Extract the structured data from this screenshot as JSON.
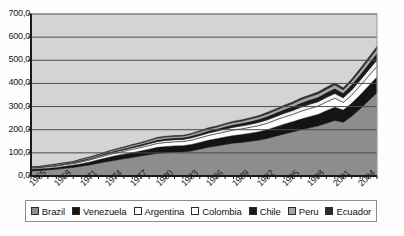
{
  "chart_data": {
    "type": "area",
    "stacked": true,
    "title": "",
    "subtitle": "",
    "xlabel": "",
    "ylabel": "",
    "grid": true,
    "legend_position": "bottom",
    "ylim": [
      0,
      700
    ],
    "ytick_step": 100,
    "ytick_labels": [
      "0,0",
      "100,0",
      "200,0",
      "300,0",
      "400,0",
      "500,0",
      "600,0",
      "700,0"
    ],
    "ytick_values": [
      0,
      100,
      200,
      300,
      400,
      500,
      600,
      700
    ],
    "xlim": [
      1965,
      2006
    ],
    "xtick_labels": [
      "1965",
      "1968",
      "1971",
      "1974",
      "1977",
      "1980",
      "1983",
      "1986",
      "1989",
      "1992",
      "1995",
      "1998",
      "2001",
      "2004"
    ],
    "xtick_values": [
      1965,
      1968,
      1971,
      1974,
      1977,
      1980,
      1983,
      1986,
      1989,
      1992,
      1995,
      1998,
      2001,
      2004
    ],
    "x": [
      1965,
      1966,
      1967,
      1968,
      1969,
      1970,
      1971,
      1972,
      1973,
      1974,
      1975,
      1976,
      1977,
      1978,
      1979,
      1980,
      1981,
      1982,
      1983,
      1984,
      1985,
      1986,
      1987,
      1988,
      1989,
      1990,
      1991,
      1992,
      1993,
      1994,
      1995,
      1996,
      1997,
      1998,
      1999,
      2000,
      2001,
      2002,
      2003,
      2004,
      2005,
      2006
    ],
    "series": [
      {
        "name": "Brazil",
        "color": "#8d8d8d",
        "values": [
          22,
          24,
          26,
          29,
          33,
          37,
          42,
          48,
          55,
          62,
          68,
          74,
          80,
          86,
          92,
          98,
          100,
          103,
          104,
          108,
          116,
          124,
          130,
          136,
          142,
          145,
          150,
          155,
          162,
          172,
          182,
          190,
          200,
          208,
          216,
          228,
          240,
          232,
          258,
          290,
          325,
          360
        ]
      },
      {
        "name": "Venezuela",
        "color": "#141414",
        "values": [
          7,
          7,
          8,
          8,
          9,
          10,
          11,
          13,
          15,
          17,
          19,
          20,
          21,
          22,
          24,
          26,
          27,
          27,
          27,
          28,
          29,
          30,
          31,
          32,
          33,
          34,
          35,
          36,
          38,
          40,
          42,
          44,
          46,
          48,
          50,
          54,
          57,
          53,
          56,
          60,
          64,
          68
        ]
      },
      {
        "name": "Argentina",
        "color": "#fdfdfd",
        "values": [
          5,
          5,
          6,
          6,
          7,
          7,
          8,
          9,
          10,
          11,
          12,
          13,
          14,
          15,
          16,
          17,
          18,
          18,
          18,
          19,
          20,
          21,
          22,
          23,
          24,
          25,
          26,
          27,
          28,
          30,
          31,
          32,
          34,
          35,
          36,
          38,
          39,
          33,
          36,
          40,
          43,
          46
        ]
      },
      {
        "name": "Colombia",
        "color": "#f2f2f2",
        "values": [
          2,
          2,
          2,
          3,
          3,
          3,
          4,
          4,
          5,
          5,
          6,
          6,
          7,
          7,
          8,
          8,
          9,
          9,
          9,
          10,
          10,
          11,
          11,
          12,
          12,
          13,
          13,
          14,
          15,
          15,
          16,
          17,
          18,
          19,
          19,
          20,
          21,
          20,
          22,
          24,
          26,
          28
        ]
      },
      {
        "name": "Chile",
        "color": "#1a1a1a",
        "values": [
          2,
          2,
          2,
          3,
          3,
          3,
          4,
          4,
          4,
          5,
          5,
          6,
          6,
          7,
          7,
          8,
          8,
          8,
          8,
          9,
          9,
          10,
          10,
          11,
          12,
          12,
          13,
          14,
          15,
          16,
          17,
          18,
          19,
          20,
          20,
          21,
          22,
          21,
          23,
          25,
          27,
          29
        ]
      },
      {
        "name": "Peru",
        "color": "#a6a6a6",
        "values": [
          1,
          1,
          2,
          2,
          2,
          2,
          3,
          3,
          3,
          4,
          4,
          4,
          5,
          5,
          5,
          6,
          6,
          6,
          6,
          6,
          7,
          7,
          7,
          8,
          8,
          8,
          9,
          9,
          10,
          10,
          11,
          11,
          12,
          12,
          13,
          13,
          14,
          13,
          14,
          15,
          16,
          17
        ]
      },
      {
        "name": "Ecuador",
        "color": "#2b2b2b",
        "values": [
          1,
          1,
          1,
          1,
          1,
          1,
          2,
          2,
          2,
          2,
          3,
          3,
          3,
          3,
          4,
          4,
          4,
          4,
          4,
          4,
          5,
          5,
          5,
          5,
          6,
          6,
          6,
          6,
          7,
          7,
          7,
          8,
          8,
          8,
          9,
          9,
          9,
          9,
          10,
          10,
          11,
          12
        ]
      }
    ],
    "totals": [
      40,
      42,
      47,
      52,
      58,
      63,
      74,
      83,
      94,
      106,
      117,
      126,
      136,
      145,
      156,
      167,
      172,
      175,
      176,
      184,
      196,
      208,
      216,
      227,
      237,
      243,
      252,
      261,
      275,
      290,
      306,
      320,
      337,
      350,
      363,
      383,
      402,
      381,
      419,
      464,
      512,
      560
    ]
  },
  "legend": {
    "items": [
      {
        "label": "Brazil",
        "swatch": "#8d8d8d"
      },
      {
        "label": "Venezuela",
        "swatch": "#141414"
      },
      {
        "label": "Argentina",
        "swatch": "#ffffff"
      },
      {
        "label": "Colombia",
        "swatch": "#ffffff"
      },
      {
        "label": "Chile",
        "swatch": "#1a1a1a"
      },
      {
        "label": "Peru",
        "swatch": "#a6a6a6"
      },
      {
        "label": "Ecuador",
        "swatch": "#2b2b2b"
      }
    ]
  },
  "plot_area": {
    "background": "#d4d4d4",
    "border": "#1a1a1a",
    "gridline_color": "#4d4d4d"
  }
}
